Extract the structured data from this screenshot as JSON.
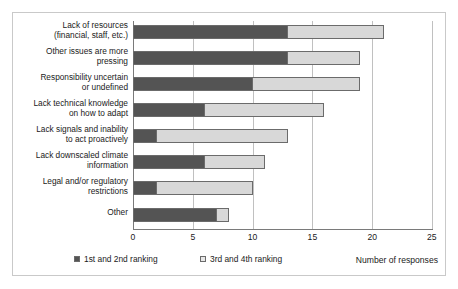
{
  "chart_data": {
    "type": "bar",
    "orientation": "horizontal",
    "stacked": true,
    "title": "",
    "xlabel": "Number of responses",
    "ylabel": "",
    "xlim": [
      0,
      25
    ],
    "xticks": [
      0,
      5,
      10,
      15,
      20,
      25
    ],
    "grid": true,
    "legend_position": "bottom",
    "categories": [
      "Lack of resources\n(financial, staff, etc.)",
      "Other issues are more\npressing",
      "Responsibility uncertain\nor undefined",
      "Lack technical knowledge\non how to adapt",
      "Lack signals and inability\nto act proactively",
      "Lack downscaled climate\ninformation",
      "Legal and/or regulatory\nrestrictions",
      "Other"
    ],
    "series": [
      {
        "name": "1st and 2nd ranking",
        "color": "#545454",
        "values": [
          13,
          13,
          10,
          6,
          2,
          6,
          2,
          7
        ]
      },
      {
        "name": "3rd and 4th ranking",
        "color": "#d8d8d8",
        "values": [
          8,
          6,
          9,
          10,
          11,
          5,
          8,
          1
        ]
      }
    ],
    "totals": [
      21,
      19,
      19,
      16,
      13,
      11,
      10,
      8
    ]
  },
  "legend": {
    "items": [
      {
        "label": "1st and 2nd ranking",
        "swatch": "dark"
      },
      {
        "label": "3rd and 4th ranking",
        "swatch": "light"
      }
    ]
  },
  "axis": {
    "x_title": "Number of responses",
    "tick_labels": [
      "0",
      "5",
      "10",
      "15",
      "20",
      "25"
    ]
  },
  "colors": {
    "series_dark": "#545454",
    "series_light": "#d8d8d8",
    "gridline": "#c0c0c0",
    "axis": "#7a7a7a",
    "frame": "#c9c9c9",
    "background": "#ffffff",
    "text": "#1a1a1a"
  }
}
